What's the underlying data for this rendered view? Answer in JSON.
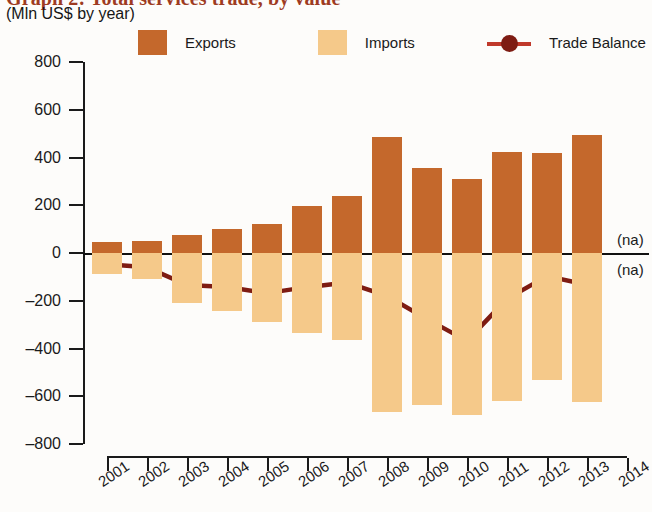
{
  "header": {
    "title": "Graph 2: Total services trade, by value",
    "subtitle": "(Mln US$ by year)"
  },
  "legend": {
    "position": "top",
    "items": [
      {
        "label": "Exports",
        "type": "swatch",
        "color": "#c4682c",
        "icon": "legend-swatch"
      },
      {
        "label": "Imports",
        "type": "swatch",
        "color": "#f5c98a",
        "icon": "legend-swatch"
      },
      {
        "label": "Trade Balance",
        "type": "line-marker",
        "color": "#7e1c13",
        "icon": "legend-line-marker"
      }
    ]
  },
  "annotations": [
    {
      "text": "(na)",
      "year": "2014",
      "position": "above-zero"
    },
    {
      "text": "(na)",
      "year": "2014",
      "position": "below-zero"
    }
  ],
  "chart_data": {
    "type": "bar",
    "title": "Graph 2: Total services trade, by value",
    "subtitle": "(Mln US$ by year)",
    "xlabel": "",
    "ylabel": "Mln US$",
    "ylim": [
      -800,
      800
    ],
    "yticks": [
      800,
      600,
      400,
      200,
      0,
      -200,
      -400,
      -600,
      -800
    ],
    "ytick_labels": [
      "800",
      "600",
      "400",
      "200",
      "0",
      "-200",
      "-400",
      "-600",
      "-800"
    ],
    "grid": false,
    "legend_position": "top",
    "categories": [
      "2001",
      "2002",
      "2003",
      "2004",
      "2005",
      "2006",
      "2007",
      "2008",
      "2009",
      "2010",
      "2011",
      "2012",
      "2013",
      "2014"
    ],
    "xtick_labels": [
      "2001",
      "2002",
      "2003",
      "2004",
      "2005",
      "2006",
      "2007",
      "2008",
      "2009",
      "2010",
      "2011",
      "2012",
      "2013",
      "2014"
    ],
    "series": [
      {
        "name": "Exports",
        "type": "bar",
        "color": "#c4682c",
        "values": [
          45,
          50,
          75,
          100,
          120,
          195,
          240,
          485,
          355,
          310,
          425,
          420,
          495,
          null
        ]
      },
      {
        "name": "Imports",
        "type": "bar",
        "color": "#f5c98a",
        "values": [
          -90,
          -110,
          -210,
          -245,
          -290,
          -335,
          -365,
          -665,
          -635,
          -680,
          -620,
          -530,
          -625,
          null
        ]
      },
      {
        "name": "Trade Balance",
        "type": "line",
        "color": "#7e1c13",
        "values": [
          -47,
          -60,
          -134,
          -142,
          -168,
          -143,
          -124,
          -180,
          -277,
          -368,
          -192,
          -97,
          -133,
          null
        ]
      }
    ]
  }
}
